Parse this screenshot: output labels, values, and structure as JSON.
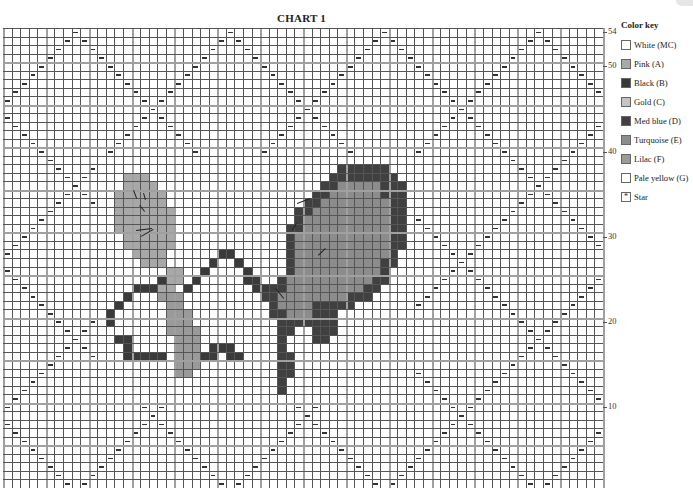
{
  "title": "CHART 1",
  "grid": {
    "columns": 70,
    "rows": 54,
    "left": 3,
    "top": 28,
    "width": 600,
    "height": 460,
    "major_every": 5
  },
  "row_numbers": [
    {
      "row": 54,
      "label": "54"
    },
    {
      "row": 50,
      "label": "50"
    },
    {
      "row": 40,
      "label": "40"
    },
    {
      "row": 30,
      "label": "30"
    },
    {
      "row": 20,
      "label": "20"
    },
    {
      "row": 10,
      "label": "10"
    }
  ],
  "pattern": {
    "symbol": "purl-dash",
    "period_cols": 18,
    "period_rows": 18,
    "col_offset": 8,
    "row_offset": 0
  },
  "colors": {
    "white_mc": "#ffffff",
    "pink_a": "#a8a8a8",
    "black_b": "#3a3a3a",
    "gold_c": "#c4c4c4",
    "med_blue_d": "#404040",
    "turquoise_e": "#8c8c8c",
    "lilac_f": "#9a9a9a",
    "pale_yellow_g": "#ffffff"
  },
  "motif": {
    "legend": {
      "P": "pink_a",
      "B": "black_b",
      "L": "lilac_f",
      "D": "med_blue_d",
      "T": "turquoise_e"
    },
    "origin_col": 12,
    "origin_row": 16,
    "rows": [
      "...........................DDDDDD..",
      "..PPP.....................DDDDDDDD.",
      "..PPPP...................DDTTTTTDDD",
      ".PPPPPP.................DDTTTTTTDDD",
      ".PPPPPP................DDTTTTTTTTDD",
      ".PPPPPPP..............DDTTTTTTTTTDD",
      ".PPPPPPP..............DTTTTTTTTTTDD",
      ".PPPPPPP.............DDTTTTTTTTTTDD",
      "..PPPPPP.............DTTTTTTTTTTTDD",
      "..PPPPPP.............DTTTTTTTTTTTDD",
      "...PPPP......BB......DTTTTTTTTTTTD.",
      "....PPP.....B..B.....DTTTTTTTTTTDD.",
      ".......PP..B....B....DTTTTTTTTTTD..",
      "......BPP.B.....BB..DTTTTTTTTTTDD..",
      "...BBBPP.B.......BBDDTTTTTTTTTDD...",
      "..B...LLL.........DDTTTTTTTTDDD....",
      ".B.....LL..........DTTTTDDDDD......",
      "B......LLL.........DDTTTDDD.......",
      "B......LLL..........DDDDDDD.......",
      ".......LLLL.........DD..DDD.......",
      ".BB.....LLL.........D...DD........",
      "..B.....LLL.BBB.....D.............",
      "..BBBBB.LLLBB.BB....DD............",
      "........LLL.........DD............",
      "........LL..........DD............",
      "....................D.............",
      "....................D............."
    ]
  },
  "strokes": [
    {
      "x1": 134,
      "y1": 190,
      "x2": 137,
      "y2": 198
    },
    {
      "x1": 144,
      "y1": 193,
      "x2": 146,
      "y2": 200
    },
    {
      "x1": 140,
      "y1": 205,
      "x2": 145,
      "y2": 211
    },
    {
      "x1": 136,
      "y1": 230,
      "x2": 152,
      "y2": 228
    },
    {
      "x1": 141,
      "y1": 236,
      "x2": 153,
      "y2": 229
    },
    {
      "x1": 297,
      "y1": 203,
      "x2": 310,
      "y2": 198
    },
    {
      "x1": 292,
      "y1": 230,
      "x2": 296,
      "y2": 223
    },
    {
      "x1": 318,
      "y1": 255,
      "x2": 325,
      "y2": 248
    },
    {
      "x1": 276,
      "y1": 288,
      "x2": 284,
      "y2": 298
    }
  ],
  "color_key": {
    "title": "Color key",
    "items": [
      {
        "label": "White (MC)",
        "color_ref": "white_mc",
        "glyph": ""
      },
      {
        "label": "Pink (A)",
        "color_ref": "pink_a",
        "glyph": ""
      },
      {
        "label": "Black (B)",
        "color_ref": "black_b",
        "glyph": ""
      },
      {
        "label": "Gold (C)",
        "color_ref": "gold_c",
        "glyph": ""
      },
      {
        "label": "Med blue (D)",
        "color_ref": "med_blue_d",
        "glyph": ""
      },
      {
        "label": "Turquoise (E)",
        "color_ref": "turquoise_e",
        "glyph": ""
      },
      {
        "label": "Lilac (F)",
        "color_ref": "lilac_f",
        "glyph": ""
      },
      {
        "label": "Pale yellow (G)",
        "color_ref": "pale_yellow_g",
        "glyph": ""
      },
      {
        "label": "Star",
        "color_ref": "white_mc",
        "glyph": "*"
      }
    ]
  }
}
